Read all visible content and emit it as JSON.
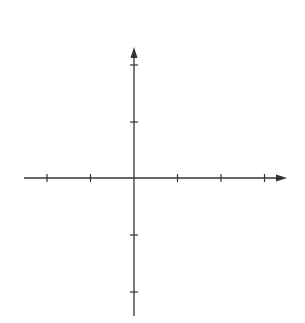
{
  "chart_data": {
    "type": "line",
    "title": "",
    "xlabel": "x",
    "ylabel": "y",
    "xlim": [
      -2.4,
      3.3
    ],
    "ylim": [
      -2.4,
      2.5
    ],
    "grid": false,
    "legend": null,
    "x_ticks": [
      -2,
      -1,
      1,
      2,
      3
    ],
    "x_tick_labels": [
      "−2",
      "−1",
      "1",
      "2",
      "3"
    ],
    "y_ticks": [
      -2,
      -1,
      1,
      2
    ],
    "y_tick_labels": [
      "−2",
      "−1",
      "1",
      "2"
    ],
    "curve": "4y^2 = x^3 - 4x",
    "series": [
      {
        "name": "closed-loop",
        "x_range": [
          -2,
          0
        ],
        "points": [
          [
            -2,
            0
          ],
          [
            -1.8,
            0.65
          ],
          [
            -1.5,
            0.83
          ],
          [
            -1.15,
            0.88
          ],
          [
            -0.8,
            0.83
          ],
          [
            -0.5,
            0.68
          ],
          [
            -0.2,
            0.44
          ],
          [
            0,
            0
          ],
          [
            -0.2,
            -0.44
          ],
          [
            -0.5,
            -0.68
          ],
          [
            -0.8,
            -0.83
          ],
          [
            -1.15,
            -0.88
          ],
          [
            -1.5,
            -0.83
          ],
          [
            -1.8,
            -0.65
          ],
          [
            -2,
            0
          ]
        ]
      },
      {
        "name": "unbounded-branch",
        "x_range": [
          2,
          3
        ],
        "points": [
          [
            3,
            -1.94
          ],
          [
            2.5,
            -1.05
          ],
          [
            2.2,
            -0.63
          ],
          [
            2.05,
            -0.32
          ],
          [
            2,
            0
          ],
          [
            2.05,
            0.32
          ],
          [
            2.2,
            0.63
          ],
          [
            2.5,
            1.05
          ],
          [
            3,
            1.94
          ]
        ]
      }
    ]
  },
  "axes": {
    "x_label": "x",
    "y_label": "y"
  },
  "ticks": {
    "x": [
      {
        "v": -2,
        "label": "−2"
      },
      {
        "v": -1,
        "label": "−1"
      },
      {
        "v": 1,
        "label": "1"
      },
      {
        "v": 2,
        "label": "2"
      },
      {
        "v": 3,
        "label": "3"
      }
    ],
    "y": [
      {
        "v": 2,
        "label": "2"
      },
      {
        "v": 1,
        "label": "1"
      },
      {
        "v": -1,
        "label": "−1"
      },
      {
        "v": -2,
        "label": "−2"
      }
    ]
  }
}
